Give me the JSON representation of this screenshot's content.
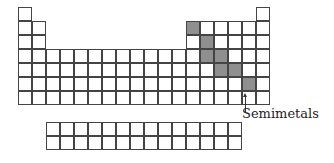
{
  "diagram": {
    "title": "",
    "label": "Semimetals",
    "main_table": {
      "origin_x": 18,
      "origin_y": 7,
      "cell_size": 14,
      "rows": [
        {
          "row": 1,
          "cols": [
            1,
            18
          ]
        },
        {
          "row": 2,
          "cols": [
            1,
            2,
            13,
            14,
            15,
            16,
            17,
            18
          ]
        },
        {
          "row": 3,
          "cols": [
            1,
            2,
            13,
            14,
            15,
            16,
            17,
            18
          ]
        },
        {
          "row": 4,
          "cols": [
            1,
            2,
            3,
            4,
            5,
            6,
            7,
            8,
            9,
            10,
            11,
            12,
            13,
            14,
            15,
            16,
            17,
            18
          ]
        },
        {
          "row": 5,
          "cols": [
            1,
            2,
            3,
            4,
            5,
            6,
            7,
            8,
            9,
            10,
            11,
            12,
            13,
            14,
            15,
            16,
            17,
            18
          ]
        },
        {
          "row": 6,
          "cols": [
            1,
            2,
            3,
            4,
            5,
            6,
            7,
            8,
            9,
            10,
            11,
            12,
            13,
            14,
            15,
            16,
            17,
            18
          ]
        },
        {
          "row": 7,
          "cols": [
            1,
            2,
            3,
            4,
            5,
            6,
            7,
            8,
            9,
            10,
            11,
            12,
            13,
            14,
            15,
            16,
            17,
            18
          ]
        }
      ],
      "shaded": [
        [
          2,
          13
        ],
        [
          3,
          14
        ],
        [
          4,
          14
        ],
        [
          4,
          15
        ],
        [
          5,
          15
        ],
        [
          5,
          16
        ],
        [
          6,
          17
        ]
      ]
    },
    "f_block": {
      "origin_x": 46,
      "origin_y": 122,
      "cell_size": 14,
      "rows": 2,
      "cols": 14
    },
    "colors": {
      "line": "#444444",
      "shaded": "#8f8f8f",
      "background": "#ffffff"
    }
  }
}
